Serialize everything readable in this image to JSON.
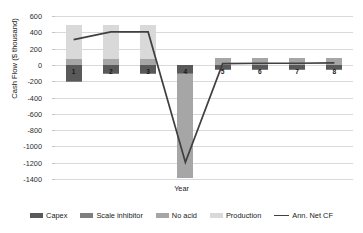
{
  "chart_data": {
    "type": "bar",
    "title": "",
    "xlabel": "Year",
    "ylabel": "Cash Flow ($ thousand)",
    "categories": [
      "1",
      "2",
      "3",
      "4",
      "5",
      "6",
      "7",
      "8"
    ],
    "ylim": [
      -1400,
      600
    ],
    "ytick_values": [
      600,
      400,
      200,
      0,
      -200,
      -400,
      -600,
      -800,
      -1000,
      -1200,
      -1400
    ],
    "ytick_labels": [
      "600",
      "400",
      "200",
      "0",
      "-200",
      "-400",
      "-600",
      "-800",
      "-1000",
      "-1200",
      "-1400"
    ],
    "grid": true,
    "legend_position": "bottom",
    "stacked": true,
    "series": [
      {
        "name": "Capex",
        "type": "bar",
        "color": "#595959",
        "values": [
          -200,
          -100,
          -100,
          -100,
          -55,
          -55,
          -55,
          -55
        ]
      },
      {
        "name": "Scale inhibitor",
        "type": "bar",
        "color": "#7f7f7f",
        "values": [
          -10,
          -10,
          -10,
          -10,
          -10,
          -10,
          -10,
          -10
        ]
      },
      {
        "name": "No acid",
        "type": "bar",
        "color": "#a6a6a6",
        "values": [
          75,
          75,
          75,
          -1280,
          85,
          85,
          85,
          85
        ]
      },
      {
        "name": "Production",
        "type": "bar",
        "color": "#d9d9d9",
        "values": [
          415,
          415,
          415,
          0,
          0,
          0,
          0,
          0
        ]
      },
      {
        "name": "Ann. Net CF",
        "type": "line",
        "color": "#404040",
        "values": [
          310,
          405,
          405,
          -1195,
          15,
          20,
          20,
          25
        ]
      }
    ]
  },
  "legend": {
    "items": [
      {
        "label": "Capex",
        "icon": "legend-swatch-capex"
      },
      {
        "label": "Scale inhibitor",
        "icon": "legend-swatch-scale-inhibitor"
      },
      {
        "label": "No acid",
        "icon": "legend-swatch-no-acid"
      },
      {
        "label": "Production",
        "icon": "legend-swatch-production"
      },
      {
        "label": "Ann. Net CF",
        "icon": "legend-line-ann-net-cf"
      }
    ]
  },
  "colors": {
    "capex": "#595959",
    "scale_inhibitor": "#7f7f7f",
    "no_acid": "#a6a6a6",
    "production": "#d9d9d9",
    "ann_net_cf": "#404040",
    "gridline": "#d9d9d9",
    "text": "#1a1a1a",
    "background": "#ffffff"
  }
}
